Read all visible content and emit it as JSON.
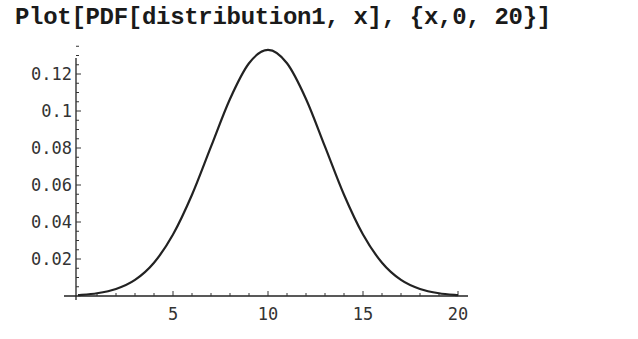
{
  "input_cell": {
    "command": "Plot[PDF[distribution1, x], {x,0, 20}]"
  },
  "chart_data": {
    "type": "line",
    "title": "",
    "xlabel": "",
    "ylabel": "",
    "xlim": [
      0,
      20
    ],
    "ylim": [
      0,
      0.13
    ],
    "grid": false,
    "legend": null,
    "x_ticks": [
      5,
      10,
      15,
      20
    ],
    "x_tick_labels": [
      "5",
      "10",
      "15",
      "20"
    ],
    "y_ticks": [
      0.02,
      0.04,
      0.06,
      0.08,
      0.1,
      0.12
    ],
    "y_tick_labels": [
      "0.02",
      "0.04",
      "0.06",
      "0.08",
      "0.1",
      "0.12"
    ],
    "series": [
      {
        "name": "PDF[distribution1, x]",
        "description": "bell-shaped curve, approx Normal(mean 10, sd 3)",
        "x": [
          0,
          1,
          2,
          3,
          4,
          5,
          6,
          7,
          8,
          9,
          10,
          11,
          12,
          13,
          14,
          15,
          16,
          17,
          18,
          19,
          20
        ],
        "values": [
          0.0005,
          0.0015,
          0.0038,
          0.0087,
          0.018,
          0.0332,
          0.0547,
          0.0807,
          0.1065,
          0.1258,
          0.133,
          0.1258,
          0.1065,
          0.0807,
          0.0547,
          0.0332,
          0.018,
          0.0087,
          0.0038,
          0.0015,
          0.0005
        ]
      }
    ]
  }
}
